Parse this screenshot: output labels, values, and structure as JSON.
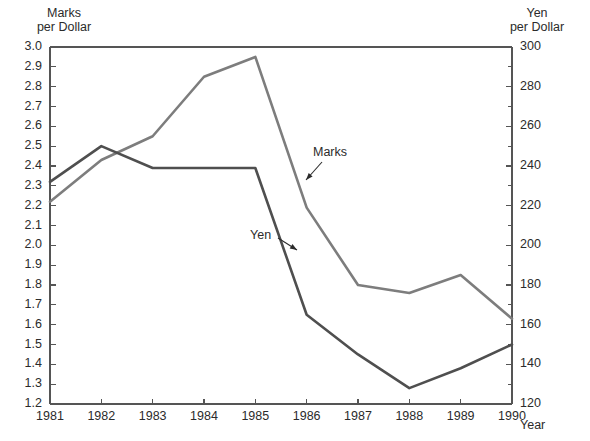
{
  "chart_data": {
    "type": "line",
    "title": "",
    "xlabel": "Year",
    "ylabel": "Marks per Dollar",
    "y2label": "Yen per Dollar",
    "grid": false,
    "legend_position": "inline-annotations",
    "x": [
      1981,
      1982,
      1983,
      1984,
      1985,
      1986,
      1987,
      1988,
      1989,
      1990
    ],
    "xtick_labels": [
      "1981",
      "1982",
      "1983",
      "1984",
      "1985",
      "1986",
      "1987",
      "1988",
      "1989",
      "1990"
    ],
    "xlim": [
      1981,
      1990
    ],
    "ylim": [
      1.2,
      3.0
    ],
    "ytick_labels": [
      "3.0",
      "2.9",
      "2.8",
      "2.7",
      "2.6",
      "2.5",
      "2.4",
      "2.3",
      "2.2",
      "2.1",
      "2.0",
      "1.9",
      "1.8",
      "1.7",
      "1.6",
      "1.5",
      "1.4",
      "1.3",
      "1.2"
    ],
    "ytick_values": [
      3.0,
      2.9,
      2.8,
      2.7,
      2.6,
      2.5,
      2.4,
      2.3,
      2.2,
      2.1,
      2.0,
      1.9,
      1.8,
      1.7,
      1.6,
      1.5,
      1.4,
      1.3,
      1.2
    ],
    "y2lim": [
      120,
      300
    ],
    "y2tick_labels": [
      "300",
      "280",
      "260",
      "240",
      "220",
      "200",
      "180",
      "160",
      "140",
      "120"
    ],
    "y2tick_values": [
      300,
      280,
      260,
      240,
      220,
      200,
      180,
      160,
      140,
      120
    ],
    "y2_minor_ticks": [
      290,
      270,
      250,
      230,
      210,
      190,
      170,
      150,
      130
    ],
    "series": [
      {
        "name": "Marks",
        "axis": "left",
        "units": "Marks per Dollar",
        "color": "#7d7d7d",
        "values": [
          2.22,
          2.43,
          2.55,
          2.85,
          2.95,
          2.19,
          1.8,
          1.76,
          1.85,
          1.63
        ]
      },
      {
        "name": "Yen",
        "axis": "right",
        "units": "Yen per Dollar",
        "color": "#4f4f4f",
        "values": [
          232,
          250,
          239,
          239,
          239,
          165,
          145,
          128,
          138,
          150
        ]
      }
    ],
    "annotations": [
      {
        "text": "Marks",
        "series": "Marks",
        "note": "arrow points down-left to Marks line near 1986"
      },
      {
        "text": "Yen",
        "series": "Yen",
        "note": "arrow points down-right to Yen line near 1986"
      }
    ]
  },
  "axes": {
    "left_title_line1": "Marks",
    "left_title_line2": "per Dollar",
    "right_title_line1": "Yen",
    "right_title_line2": "per Dollar",
    "x_title": "Year"
  },
  "labels": {
    "marks": "Marks",
    "yen": "Yen"
  },
  "colors": {
    "marks_line": "#7d7d7d",
    "yen_line": "#4f4f4f",
    "axis": "#555555",
    "text": "#2b2b2b",
    "background": "#ffffff"
  }
}
